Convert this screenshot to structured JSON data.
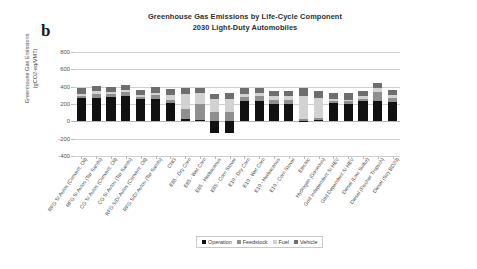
{
  "panel": {
    "letter": "b"
  },
  "chart_data": {
    "type": "bar",
    "stacked": true,
    "title": "Greenhouse Gas Emissions by Life-Cycle Component",
    "subtitle": "2030 Light-Duty Automobiles",
    "ylabel_line1": "Greenhouse Gas Emissions",
    "ylabel_line2": "(gCO2-eq/VMT)",
    "xlabel": "",
    "ylim": [
      -400,
      800
    ],
    "yticks": [
      800,
      600,
      400,
      200,
      0,
      -200,
      -400
    ],
    "grid": true,
    "legend_position": "bottom",
    "categories": [
      "RFG SI Autos (Convent. Oil)",
      "RFG SI Autos (Tar Sands)",
      "CG SI Autos (Convent. Oil)",
      "CG SI Autos (Tar Sands)",
      "RFG SIDI Autos (Convent. Oil)",
      "RFG SIDI Autos (Tar Sands)",
      "CNG",
      "E85 - Dry Corn",
      "E85 - Wet Corn",
      "E85 - Herbaceous",
      "E85 - Corn Stover",
      "E10 - Dry Corn",
      "E10 - Wet Corn",
      "E10 - Herbaceous",
      "E10 - Corn Stover",
      "Electric",
      "Hydrogen (Gaseous)",
      "Grid Independent SI HEV",
      "Grid Dependent SI HEV",
      "Diesel (Low Sulfur)",
      "Diesel (Fischer Tropsch)",
      "Diesel (Soy BD20)"
    ],
    "series": [
      {
        "name": "Operation",
        "color": "#111111",
        "values": [
          270,
          272,
          285,
          287,
          258,
          260,
          215,
          25,
          20,
          -130,
          -135,
          240,
          238,
          205,
          200,
          8,
          18,
          212,
          205,
          232,
          238,
          222
        ]
      },
      {
        "name": "Feedstock",
        "color": "#8f8f8f",
        "values": [
          28,
          45,
          30,
          48,
          26,
          42,
          35,
          120,
          175,
          105,
          108,
          45,
          58,
          40,
          42,
          18,
          22,
          26,
          24,
          30,
          98,
          48
        ]
      },
      {
        "name": "Fuel",
        "color": "#d2d2d2",
        "values": [
          22,
          30,
          22,
          30,
          20,
          28,
          55,
          175,
          132,
          150,
          152,
          35,
          30,
          42,
          45,
          265,
          225,
          20,
          18,
          25,
          48,
          35
        ]
      },
      {
        "name": "Vehicle",
        "color": "#6e6e6e",
        "values": [
          60,
          60,
          58,
          58,
          62,
          62,
          68,
          62,
          62,
          62,
          62,
          60,
          60,
          60,
          60,
          95,
          88,
          74,
          78,
          62,
          62,
          62
        ]
      }
    ],
    "negative_note": "E85 - Herbaceous and E85 - Corn Stover show negative operation/feedstock credits"
  },
  "legend": {
    "items": [
      {
        "label": "Operation",
        "key": "operation"
      },
      {
        "label": "Feedstock",
        "key": "feedstock"
      },
      {
        "label": "Fuel",
        "key": "fuel"
      },
      {
        "label": "Vehicle",
        "key": "vehicle"
      }
    ]
  }
}
